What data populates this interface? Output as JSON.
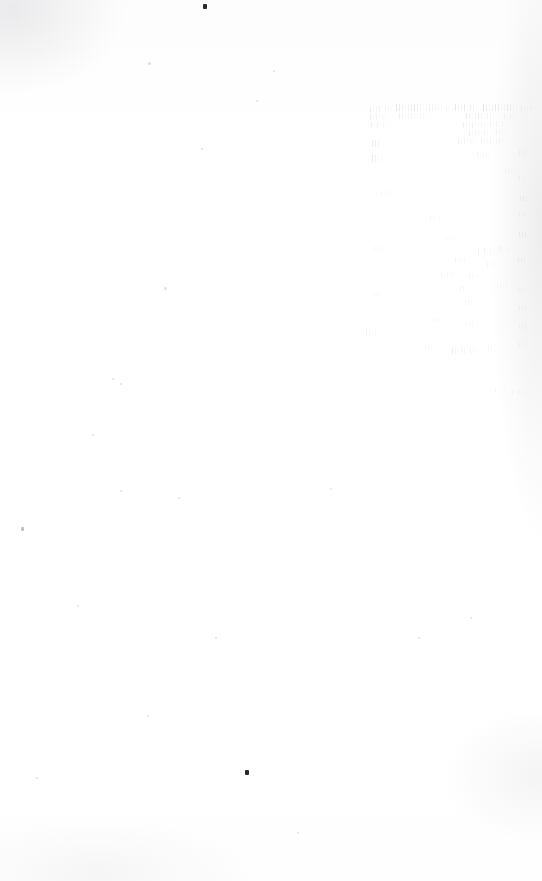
{
  "document": {
    "kind": "scanned-page",
    "condition": "almost entirely blank; ink faded to near-invisibility",
    "legible_text": "",
    "note_visible_on_page": "",
    "page_width_px": 542,
    "page_height_px": 881,
    "background_color": "#ffffff",
    "paper_tone_color": "#fdfdfe",
    "ink_residue_color": "#78787f",
    "speck_color": "#2a2a2e"
  },
  "faded_text_block": {
    "present": true,
    "legible": false,
    "region": {
      "x": 365,
      "y": 100,
      "width": 172,
      "height": 300
    },
    "columns": 2,
    "column_left_x": 370,
    "column_right_x": 455,
    "lines": [
      {
        "x": 370,
        "y": 106,
        "w": 22,
        "h": 6,
        "opacity": 0.3
      },
      {
        "x": 396,
        "y": 104,
        "w": 46,
        "h": 7,
        "opacity": 0.42
      },
      {
        "x": 446,
        "y": 106,
        "w": 6,
        "h": 6,
        "opacity": 0.22
      },
      {
        "x": 455,
        "y": 104,
        "w": 22,
        "h": 7,
        "opacity": 0.4
      },
      {
        "x": 483,
        "y": 104,
        "w": 34,
        "h": 7,
        "opacity": 0.46
      },
      {
        "x": 521,
        "y": 106,
        "w": 12,
        "h": 5,
        "opacity": 0.24
      },
      {
        "x": 370,
        "y": 114,
        "w": 18,
        "h": 6,
        "opacity": 0.26
      },
      {
        "x": 399,
        "y": 113,
        "w": 30,
        "h": 6,
        "opacity": 0.24
      },
      {
        "x": 466,
        "y": 113,
        "w": 30,
        "h": 6,
        "opacity": 0.34
      },
      {
        "x": 504,
        "y": 114,
        "w": 14,
        "h": 5,
        "opacity": 0.2
      },
      {
        "x": 371,
        "y": 122,
        "w": 16,
        "h": 6,
        "opacity": 0.24
      },
      {
        "x": 463,
        "y": 122,
        "w": 24,
        "h": 6,
        "opacity": 0.26
      },
      {
        "x": 490,
        "y": 121,
        "w": 16,
        "h": 6,
        "opacity": 0.22
      },
      {
        "x": 469,
        "y": 130,
        "w": 20,
        "h": 6,
        "opacity": 0.28
      },
      {
        "x": 496,
        "y": 130,
        "w": 12,
        "h": 5,
        "opacity": 0.18
      },
      {
        "x": 372,
        "y": 140,
        "w": 9,
        "h": 7,
        "opacity": 0.32
      },
      {
        "x": 458,
        "y": 138,
        "w": 18,
        "h": 6,
        "opacity": 0.26
      },
      {
        "x": 481,
        "y": 138,
        "w": 22,
        "h": 6,
        "opacity": 0.24
      },
      {
        "x": 372,
        "y": 155,
        "w": 11,
        "h": 7,
        "opacity": 0.34
      },
      {
        "x": 477,
        "y": 152,
        "w": 14,
        "h": 6,
        "opacity": 0.2
      },
      {
        "x": 519,
        "y": 150,
        "w": 8,
        "h": 5,
        "opacity": 0.18
      },
      {
        "x": 505,
        "y": 168,
        "w": 10,
        "h": 5,
        "opacity": 0.16
      },
      {
        "x": 519,
        "y": 176,
        "w": 7,
        "h": 5,
        "opacity": 0.18
      },
      {
        "x": 381,
        "y": 190,
        "w": 14,
        "h": 5,
        "opacity": 0.16
      },
      {
        "x": 520,
        "y": 196,
        "w": 8,
        "h": 5,
        "opacity": 0.2
      },
      {
        "x": 430,
        "y": 216,
        "w": 12,
        "h": 5,
        "opacity": 0.16
      },
      {
        "x": 519,
        "y": 212,
        "w": 8,
        "h": 5,
        "opacity": 0.18
      },
      {
        "x": 446,
        "y": 236,
        "w": 10,
        "h": 5,
        "opacity": 0.16
      },
      {
        "x": 519,
        "y": 232,
        "w": 9,
        "h": 5,
        "opacity": 0.2
      },
      {
        "x": 374,
        "y": 246,
        "w": 10,
        "h": 5,
        "opacity": 0.18
      },
      {
        "x": 478,
        "y": 248,
        "w": 16,
        "h": 6,
        "opacity": 0.22
      },
      {
        "x": 499,
        "y": 246,
        "w": 12,
        "h": 5,
        "opacity": 0.18
      },
      {
        "x": 455,
        "y": 258,
        "w": 12,
        "h": 5,
        "opacity": 0.18
      },
      {
        "x": 487,
        "y": 262,
        "w": 10,
        "h": 5,
        "opacity": 0.16
      },
      {
        "x": 518,
        "y": 258,
        "w": 9,
        "h": 5,
        "opacity": 0.2
      },
      {
        "x": 441,
        "y": 272,
        "w": 14,
        "h": 5,
        "opacity": 0.2
      },
      {
        "x": 469,
        "y": 274,
        "w": 11,
        "h": 5,
        "opacity": 0.16
      },
      {
        "x": 460,
        "y": 286,
        "w": 10,
        "h": 5,
        "opacity": 0.18
      },
      {
        "x": 497,
        "y": 284,
        "w": 12,
        "h": 5,
        "opacity": 0.16
      },
      {
        "x": 518,
        "y": 288,
        "w": 8,
        "h": 5,
        "opacity": 0.18
      },
      {
        "x": 374,
        "y": 292,
        "w": 8,
        "h": 5,
        "opacity": 0.16
      },
      {
        "x": 465,
        "y": 300,
        "w": 9,
        "h": 5,
        "opacity": 0.16
      },
      {
        "x": 519,
        "y": 306,
        "w": 8,
        "h": 5,
        "opacity": 0.18
      },
      {
        "x": 433,
        "y": 318,
        "w": 12,
        "h": 5,
        "opacity": 0.18
      },
      {
        "x": 466,
        "y": 322,
        "w": 9,
        "h": 5,
        "opacity": 0.14
      },
      {
        "x": 519,
        "y": 324,
        "w": 8,
        "h": 5,
        "opacity": 0.16
      },
      {
        "x": 366,
        "y": 330,
        "w": 12,
        "h": 7,
        "opacity": 0.22
      },
      {
        "x": 425,
        "y": 344,
        "w": 10,
        "h": 5,
        "opacity": 0.16
      },
      {
        "x": 452,
        "y": 348,
        "w": 26,
        "h": 6,
        "opacity": 0.26
      },
      {
        "x": 488,
        "y": 346,
        "w": 10,
        "h": 5,
        "opacity": 0.14
      },
      {
        "x": 519,
        "y": 342,
        "w": 8,
        "h": 5,
        "opacity": 0.16
      },
      {
        "x": 495,
        "y": 388,
        "w": 12,
        "h": 5,
        "opacity": 0.16
      },
      {
        "x": 512,
        "y": 390,
        "w": 16,
        "h": 5,
        "opacity": 0.14
      }
    ]
  },
  "artifacts": {
    "specks": [
      {
        "name": "speck-top",
        "x": 203,
        "y": 4,
        "w": 4,
        "h": 5,
        "soft": false
      },
      {
        "name": "speck-lower",
        "x": 245,
        "y": 770,
        "w": 4,
        "h": 5,
        "soft": false
      },
      {
        "name": "speck-left-margin",
        "x": 21,
        "y": 527,
        "w": 3,
        "h": 4,
        "soft": true
      }
    ],
    "dust": [
      {
        "x": 148,
        "y": 62,
        "d": 3
      },
      {
        "x": 273,
        "y": 70,
        "d": 2
      },
      {
        "x": 256,
        "y": 100,
        "d": 2
      },
      {
        "x": 201,
        "y": 148,
        "d": 2
      },
      {
        "x": 164,
        "y": 287,
        "d": 3
      },
      {
        "x": 112,
        "y": 378,
        "d": 2
      },
      {
        "x": 120,
        "y": 383,
        "d": 2
      },
      {
        "x": 92,
        "y": 434,
        "d": 2
      },
      {
        "x": 120,
        "y": 490,
        "d": 2
      },
      {
        "x": 178,
        "y": 497,
        "d": 2
      },
      {
        "x": 77,
        "y": 605,
        "d": 2
      },
      {
        "x": 147,
        "y": 715,
        "d": 2
      },
      {
        "x": 215,
        "y": 637,
        "d": 2
      },
      {
        "x": 330,
        "y": 488,
        "d": 2
      },
      {
        "x": 418,
        "y": 637,
        "d": 2
      },
      {
        "x": 470,
        "y": 617,
        "d": 2
      },
      {
        "x": 36,
        "y": 777,
        "d": 2
      },
      {
        "x": 297,
        "y": 832,
        "d": 2
      }
    ]
  }
}
